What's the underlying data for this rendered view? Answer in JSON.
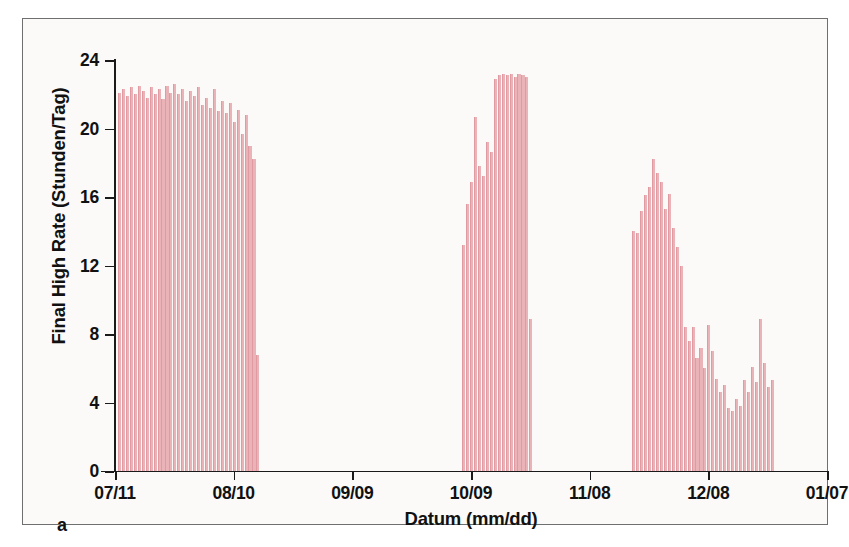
{
  "figure": {
    "panel_letter": "a",
    "background_color": "#fbfaf9",
    "frame_color": "#6f6f6f",
    "bar_color": "#eab3b8",
    "axis_color": "#1a1a1a"
  },
  "chart_data": {
    "type": "bar",
    "title": "",
    "subtitle": "",
    "xlabel": "Datum (mm/dd)",
    "ylabel": "Final High Rate (Stunden/Tag)",
    "ylim": [
      0,
      24
    ],
    "ytick_values": [
      0,
      4,
      8,
      12,
      16,
      20,
      24
    ],
    "ytick_labels": [
      "0",
      "4",
      "8",
      "12",
      "16",
      "20",
      "24"
    ],
    "xtick_labels": [
      "07/11",
      "08/10",
      "09/09",
      "10/09",
      "11/08",
      "12/08",
      "01/07"
    ],
    "xtick_positions": [
      0,
      30,
      60,
      90,
      120,
      150,
      180
    ],
    "xlim": [
      0,
      180
    ],
    "x_unit": "days since 07/11",
    "grid": false,
    "legend": null,
    "legend_position": "none",
    "annotations": [
      "a"
    ],
    "series": [
      {
        "name": "Final High Rate",
        "units": "Stunden/Tag",
        "points": [
          {
            "x": 1,
            "y": 22.1
          },
          {
            "x": 2,
            "y": 22.3
          },
          {
            "x": 3,
            "y": 21.9
          },
          {
            "x": 4,
            "y": 22.4
          },
          {
            "x": 5,
            "y": 22.0
          },
          {
            "x": 6,
            "y": 22.5
          },
          {
            "x": 7,
            "y": 22.2
          },
          {
            "x": 8,
            "y": 21.8
          },
          {
            "x": 9,
            "y": 22.4
          },
          {
            "x": 10,
            "y": 22.0
          },
          {
            "x": 11,
            "y": 22.3
          },
          {
            "x": 12,
            "y": 21.7
          },
          {
            "x": 13,
            "y": 22.5
          },
          {
            "x": 14,
            "y": 22.1
          },
          {
            "x": 15,
            "y": 22.6
          },
          {
            "x": 16,
            "y": 22.0
          },
          {
            "x": 17,
            "y": 22.3
          },
          {
            "x": 18,
            "y": 21.6
          },
          {
            "x": 19,
            "y": 22.2
          },
          {
            "x": 20,
            "y": 21.9
          },
          {
            "x": 21,
            "y": 22.4
          },
          {
            "x": 22,
            "y": 21.4
          },
          {
            "x": 23,
            "y": 21.8
          },
          {
            "x": 24,
            "y": 21.2
          },
          {
            "x": 25,
            "y": 22.3
          },
          {
            "x": 26,
            "y": 21.0
          },
          {
            "x": 27,
            "y": 21.6
          },
          {
            "x": 28,
            "y": 20.9
          },
          {
            "x": 29,
            "y": 21.5
          },
          {
            "x": 30,
            "y": 20.4
          },
          {
            "x": 31,
            "y": 21.1
          },
          {
            "x": 32,
            "y": 19.7
          },
          {
            "x": 33,
            "y": 20.8
          },
          {
            "x": 34,
            "y": 19.0
          },
          {
            "x": 35,
            "y": 18.2
          },
          {
            "x": 36,
            "y": 6.8
          },
          {
            "x": 88,
            "y": 13.2
          },
          {
            "x": 89,
            "y": 15.6
          },
          {
            "x": 90,
            "y": 16.9
          },
          {
            "x": 91,
            "y": 20.7
          },
          {
            "x": 92,
            "y": 17.8
          },
          {
            "x": 93,
            "y": 17.2
          },
          {
            "x": 94,
            "y": 19.2
          },
          {
            "x": 95,
            "y": 18.6
          },
          {
            "x": 96,
            "y": 22.9
          },
          {
            "x": 97,
            "y": 23.1
          },
          {
            "x": 98,
            "y": 23.2
          },
          {
            "x": 99,
            "y": 23.1
          },
          {
            "x": 100,
            "y": 23.2
          },
          {
            "x": 101,
            "y": 23.0
          },
          {
            "x": 102,
            "y": 23.2
          },
          {
            "x": 103,
            "y": 23.1
          },
          {
            "x": 104,
            "y": 23.0
          },
          {
            "x": 105,
            "y": 8.9
          },
          {
            "x": 131,
            "y": 14.0
          },
          {
            "x": 132,
            "y": 13.9
          },
          {
            "x": 133,
            "y": 15.2
          },
          {
            "x": 134,
            "y": 16.1
          },
          {
            "x": 135,
            "y": 16.6
          },
          {
            "x": 136,
            "y": 18.2
          },
          {
            "x": 137,
            "y": 17.4
          },
          {
            "x": 138,
            "y": 16.9
          },
          {
            "x": 139,
            "y": 15.3
          },
          {
            "x": 140,
            "y": 16.2
          },
          {
            "x": 141,
            "y": 14.2
          },
          {
            "x": 142,
            "y": 13.1
          },
          {
            "x": 143,
            "y": 12.0
          },
          {
            "x": 144,
            "y": 8.4
          },
          {
            "x": 145,
            "y": 7.6
          },
          {
            "x": 146,
            "y": 8.4
          },
          {
            "x": 147,
            "y": 6.6
          },
          {
            "x": 148,
            "y": 7.2
          },
          {
            "x": 149,
            "y": 6.0
          },
          {
            "x": 150,
            "y": 8.5
          },
          {
            "x": 151,
            "y": 7.0
          },
          {
            "x": 152,
            "y": 5.4
          },
          {
            "x": 153,
            "y": 4.6
          },
          {
            "x": 154,
            "y": 5.0
          },
          {
            "x": 155,
            "y": 3.7
          },
          {
            "x": 156,
            "y": 3.5
          },
          {
            "x": 157,
            "y": 4.2
          },
          {
            "x": 158,
            "y": 3.8
          },
          {
            "x": 159,
            "y": 5.3
          },
          {
            "x": 160,
            "y": 4.6
          },
          {
            "x": 161,
            "y": 6.1
          },
          {
            "x": 162,
            "y": 5.2
          },
          {
            "x": 163,
            "y": 8.9
          },
          {
            "x": 164,
            "y": 6.3
          },
          {
            "x": 165,
            "y": 4.9
          },
          {
            "x": 166,
            "y": 5.3
          }
        ]
      }
    ]
  }
}
